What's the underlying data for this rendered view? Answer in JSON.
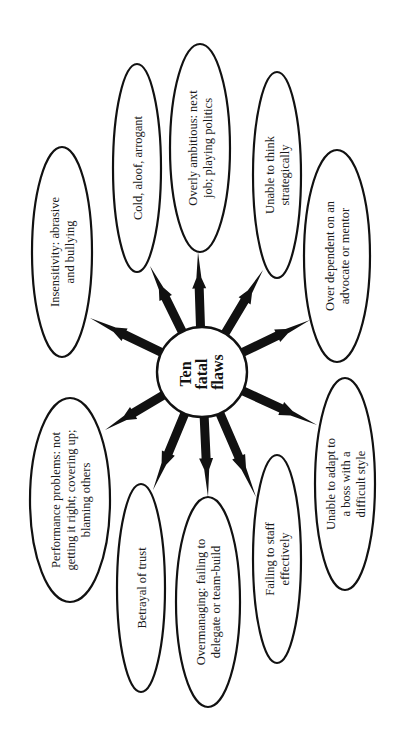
{
  "diagram": {
    "type": "hub-and-spoke",
    "orientation": "rotated-90-ccw",
    "center": {
      "label_lines": [
        "Ten",
        "fatal",
        "flaws"
      ],
      "cx": 202,
      "cy": 372,
      "r": 45
    },
    "nodes": [
      {
        "id": "insensitivity",
        "lines": [
          "Insensitivity: abrasive",
          "and bullying"
        ],
        "cx": 62,
        "cy": 252,
        "rx": 30,
        "ry": 105,
        "tip": [
          90,
          318
        ]
      },
      {
        "id": "cold",
        "lines": [
          "Cold, aloof, arrogant"
        ],
        "cx": 137,
        "cy": 168,
        "rx": 24,
        "ry": 104,
        "tip": [
          150,
          266
        ]
      },
      {
        "id": "overly-ambitious",
        "lines": [
          "Overly ambitious: next",
          "job; playing politics"
        ],
        "cx": 200,
        "cy": 148,
        "rx": 30,
        "ry": 104,
        "tip": [
          198,
          252
        ]
      },
      {
        "id": "unable-to-think",
        "lines": [
          "Unable to think",
          "strategically"
        ],
        "cx": 277,
        "cy": 175,
        "rx": 24,
        "ry": 103,
        "tip": [
          263,
          270
        ]
      },
      {
        "id": "over-dependent",
        "lines": [
          "Over dependent on an",
          "advocate or mentor"
        ],
        "cx": 337,
        "cy": 256,
        "rx": 33,
        "ry": 106,
        "tip": [
          310,
          320
        ]
      },
      {
        "id": "unable-to-adapt",
        "lines": [
          "Unable to adapt to",
          "a boss with a",
          "difficult style"
        ],
        "cx": 345,
        "cy": 484,
        "rx": 30,
        "ry": 106,
        "tip": [
          317,
          425
        ]
      },
      {
        "id": "failing-to-staff",
        "lines": [
          "Failing to staff",
          "effectively"
        ],
        "cx": 277,
        "cy": 559,
        "rx": 24,
        "ry": 104,
        "tip": [
          256,
          497
        ]
      },
      {
        "id": "overmanaging",
        "lines": [
          "Overmanaging: failing to",
          "delegate or team-build"
        ],
        "cx": 208,
        "cy": 602,
        "rx": 32,
        "ry": 105,
        "tip": [
          208,
          497
        ]
      },
      {
        "id": "betrayal-of-trust",
        "lines": [
          "Betrayal of trust"
        ],
        "cx": 141,
        "cy": 588,
        "rx": 24,
        "ry": 104,
        "tip": [
          153,
          490
        ]
      },
      {
        "id": "performance-problems",
        "lines": [
          "Performance problems: not",
          "getting it right; covering up;",
          "blaming others"
        ],
        "cx": 70,
        "cy": 500,
        "rx": 40,
        "ry": 102,
        "tip": [
          105,
          430
        ]
      }
    ]
  },
  "colors": {
    "background": "#ffffff",
    "stroke": "#111111",
    "arrow": "#111111",
    "text": "#1a1a1a"
  }
}
